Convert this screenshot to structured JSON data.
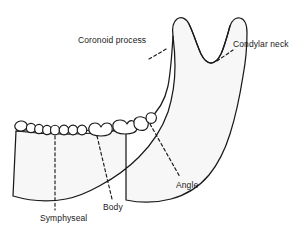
{
  "figure": {
    "background_color": "#ffffff",
    "bone_fill_color": "#f7f7f7",
    "outline_color": "#1a1a1a",
    "label_color": "#1a1a1a",
    "dashed_line_color": "#1a1a1a"
  },
  "labels": {
    "coronoid_process": "Coronoid process",
    "condylar_neck": "Condylar neck",
    "angle": "Angle",
    "body": "Body",
    "symphyseal": "Symphyseal"
  },
  "regions": [
    {
      "name": "coronoid process",
      "label": "Coronoid process",
      "leader": "dashed",
      "side": "left-superior"
    },
    {
      "name": "condylar neck",
      "label": "Condylar neck",
      "leader": "dashed",
      "side": "right-superior"
    },
    {
      "name": "angle",
      "label": "Angle",
      "leader": "dashed",
      "side": "posterior-inferior"
    },
    {
      "name": "body",
      "label": "Body",
      "leader": "dashed",
      "side": "inferior-middle"
    },
    {
      "name": "symphyseal",
      "label": "Symphyseal",
      "leader": "dashed",
      "side": "anterior-inferior"
    }
  ],
  "anatomy": {
    "teeth_count": 12,
    "teeth_types": [
      "incisor",
      "incisor",
      "incisor",
      "incisor",
      "canine",
      "premolar",
      "premolar",
      "premolar",
      "molar",
      "molar",
      "molar",
      "molar"
    ],
    "processes": [
      "coronoid process",
      "condylar process"
    ],
    "notch": "sigmoid notch"
  }
}
